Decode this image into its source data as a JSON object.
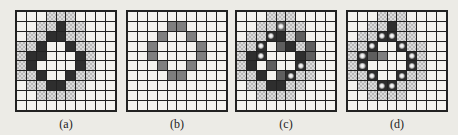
{
  "figure": {
    "panels": [
      {
        "id": "a",
        "label": "(a)",
        "left": 15,
        "rows": [
          "WWWCCCWWWW",
          "WWCCDCCWWW",
          "WCCDDCCWWW",
          "CCDWWDCCWW",
          "CDDWWWDCWW",
          "CDWWWWDCWW",
          "CCDWWDCCWW",
          "WCCDDCCWWW",
          "WWCCCCWWWW",
          "WWWWWWWWWW"
        ],
        "dots": []
      },
      {
        "id": "b",
        "label": "(b)",
        "left": 126,
        "rows": [
          "WWWWWWWWWW",
          "WWWWGGWWWW",
          "WWWGWWGWWW",
          "WWGWWWWGWW",
          "WWGWWWWGWW",
          "WWWGWWGWWW",
          "WWWWGGWWWW",
          "WWWWWWWWWW",
          "WWWWWWWWWW",
          "WWWWWWWWWW"
        ],
        "dots": []
      },
      {
        "id": "c",
        "label": "(c)",
        "left": 235,
        "rows": [
          "WWWCCCWWWW",
          "WWCCMCCWWW",
          "WCCDDCMWWW",
          "CCDWMDCMWW",
          "CDDWWWDMWW",
          "CDWMWWDCWW",
          "CCDWMDCCWW",
          "WCCDDCCWWW",
          "WWCCCCWWWW",
          "WWWWWWWWWW"
        ],
        "dots": [
          [
            1,
            4
          ],
          [
            2,
            3
          ],
          [
            3,
            2
          ],
          [
            4,
            2
          ],
          [
            5,
            6
          ],
          [
            6,
            5
          ]
        ]
      },
      {
        "id": "d",
        "label": "(d)",
        "left": 346,
        "rows": [
          "WWWCCCWWWW",
          "WWCCDCCWWW",
          "WCCDDCCWWW",
          "CCDWWDCCWW",
          "CDMGWWDCWW",
          "CDWWWWDCWW",
          "CCDWWDCCWW",
          "WCCDDCCWWW",
          "WWCCCCWWWW",
          "WWWWWWWWWW"
        ],
        "dots": [
          [
            2,
            3
          ],
          [
            2,
            4
          ],
          [
            3,
            2
          ],
          [
            3,
            5
          ],
          [
            4,
            1
          ],
          [
            4,
            6
          ],
          [
            5,
            1
          ],
          [
            5,
            6
          ],
          [
            6,
            2
          ],
          [
            6,
            5
          ],
          [
            7,
            3
          ],
          [
            7,
            4
          ]
        ]
      }
    ]
  }
}
